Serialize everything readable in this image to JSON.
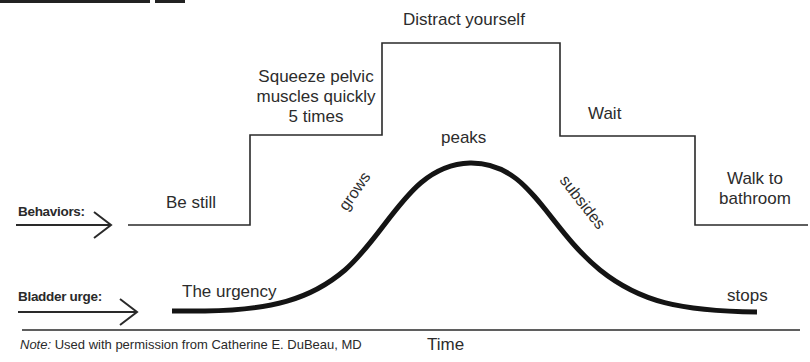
{
  "heading": {
    "text": "",
    "clipped": true
  },
  "rows": {
    "behaviors": {
      "label": "Behaviors:",
      "arrow_icon": "right-arrow-icon"
    },
    "bladder": {
      "label": "Bladder urge:",
      "arrow_icon": "right-arrow-icon"
    }
  },
  "behaviors": [
    {
      "label": "Be still",
      "level": 1
    },
    {
      "label_lines": [
        "Squeeze pelvic",
        "muscles quickly",
        "5 times"
      ],
      "level": 2
    },
    {
      "label": "Distract yourself",
      "level": 3
    },
    {
      "label": "Wait",
      "level": 2
    },
    {
      "label_lines": [
        "Walk to",
        "bathroom"
      ],
      "level": 1
    }
  ],
  "urge_curve": {
    "start_label": "The urgency",
    "rise_label": "grows",
    "peak_label": "peaks",
    "fall_label": "subsides",
    "end_label": "stops"
  },
  "axis": {
    "label": "Time"
  },
  "note": {
    "prefix": "Note:",
    "text": " Used with permission from Catherine E. DuBeau, MD"
  },
  "colors": {
    "line": "#2a2a2a",
    "curve": "#141414",
    "text": "#2c2c2c",
    "background": "#ffffff"
  }
}
